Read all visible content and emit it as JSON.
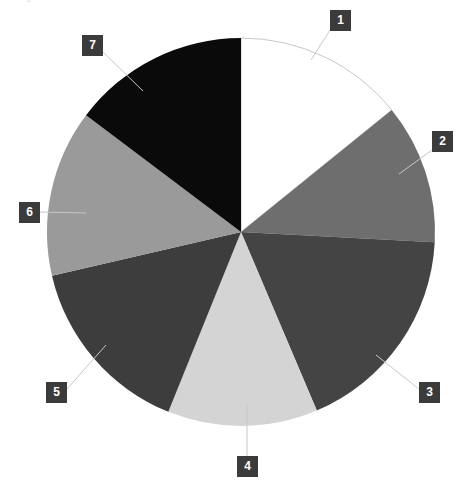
{
  "figure": {
    "caption_fragment": "g ....... ....... ........",
    "background_color": "#ffffff"
  },
  "callouts": [
    {
      "label": "1",
      "x": 330,
      "y": 10,
      "line": [
        [
          330,
          30
        ],
        [
          311,
          60
        ]
      ]
    },
    {
      "label": "2",
      "x": 432,
      "y": 131,
      "line": [
        [
          432,
          150
        ],
        [
          399,
          174
        ]
      ]
    },
    {
      "label": "3",
      "x": 419,
      "y": 382,
      "line": [
        [
          419,
          389
        ],
        [
          376,
          355
        ]
      ]
    },
    {
      "label": "4",
      "x": 237,
      "y": 456,
      "line": [
        [
          247,
          456
        ],
        [
          247,
          404
        ]
      ]
    },
    {
      "label": "5",
      "x": 46,
      "y": 382,
      "line": [
        [
          67,
          389
        ],
        [
          106,
          345
        ]
      ]
    },
    {
      "label": "6",
      "x": 19,
      "y": 202,
      "line": [
        [
          40,
          212
        ],
        [
          86,
          213
        ]
      ]
    },
    {
      "label": "7",
      "x": 82,
      "y": 35,
      "line": [
        [
          103,
          52
        ],
        [
          143,
          91
        ]
      ]
    }
  ],
  "chart_data": {
    "type": "pie",
    "title": "",
    "subtitle": "",
    "xlabel": "",
    "ylabel": "",
    "legend_position": "callout-labels",
    "grid": false,
    "center": {
      "x": 241,
      "y": 232
    },
    "radius": 194,
    "start_angle_deg": 0,
    "direction": "clockwise",
    "categories": [
      "1",
      "2",
      "3",
      "4",
      "5",
      "6",
      "7"
    ],
    "values": [
      14.2,
      11.7,
      17.8,
      12.5,
      15.3,
      13.9,
      14.6
    ],
    "units": "percent",
    "slices": [
      {
        "label": "1",
        "value": 14.2,
        "start_deg": 0,
        "end_deg": 51.0,
        "color": "#ffffff",
        "stroke": "#c8c8c8"
      },
      {
        "label": "2",
        "value": 11.7,
        "start_deg": 51.0,
        "end_deg": 93.0,
        "color": "#6e6e6e",
        "stroke": "none"
      },
      {
        "label": "3",
        "value": 17.8,
        "start_deg": 93.0,
        "end_deg": 157.0,
        "color": "#444444",
        "stroke": "none"
      },
      {
        "label": "4",
        "value": 12.5,
        "start_deg": 157.0,
        "end_deg": 202.0,
        "color": "#d4d4d4",
        "stroke": "none"
      },
      {
        "label": "5",
        "value": 15.3,
        "start_deg": 202.0,
        "end_deg": 257.0,
        "color": "#3d3d3d",
        "stroke": "none"
      },
      {
        "label": "6",
        "value": 13.9,
        "start_deg": 257.0,
        "end_deg": 307.0,
        "color": "#9a9a9a",
        "stroke": "none"
      },
      {
        "label": "7",
        "value": 14.6,
        "start_deg": 307.0,
        "end_deg": 360.0,
        "color": "#0a0a0a",
        "stroke": "none"
      }
    ],
    "colors": [
      "#ffffff",
      "#6e6e6e",
      "#444444",
      "#d4d4d4",
      "#3d3d3d",
      "#9a9a9a",
      "#0a0a0a"
    ]
  }
}
